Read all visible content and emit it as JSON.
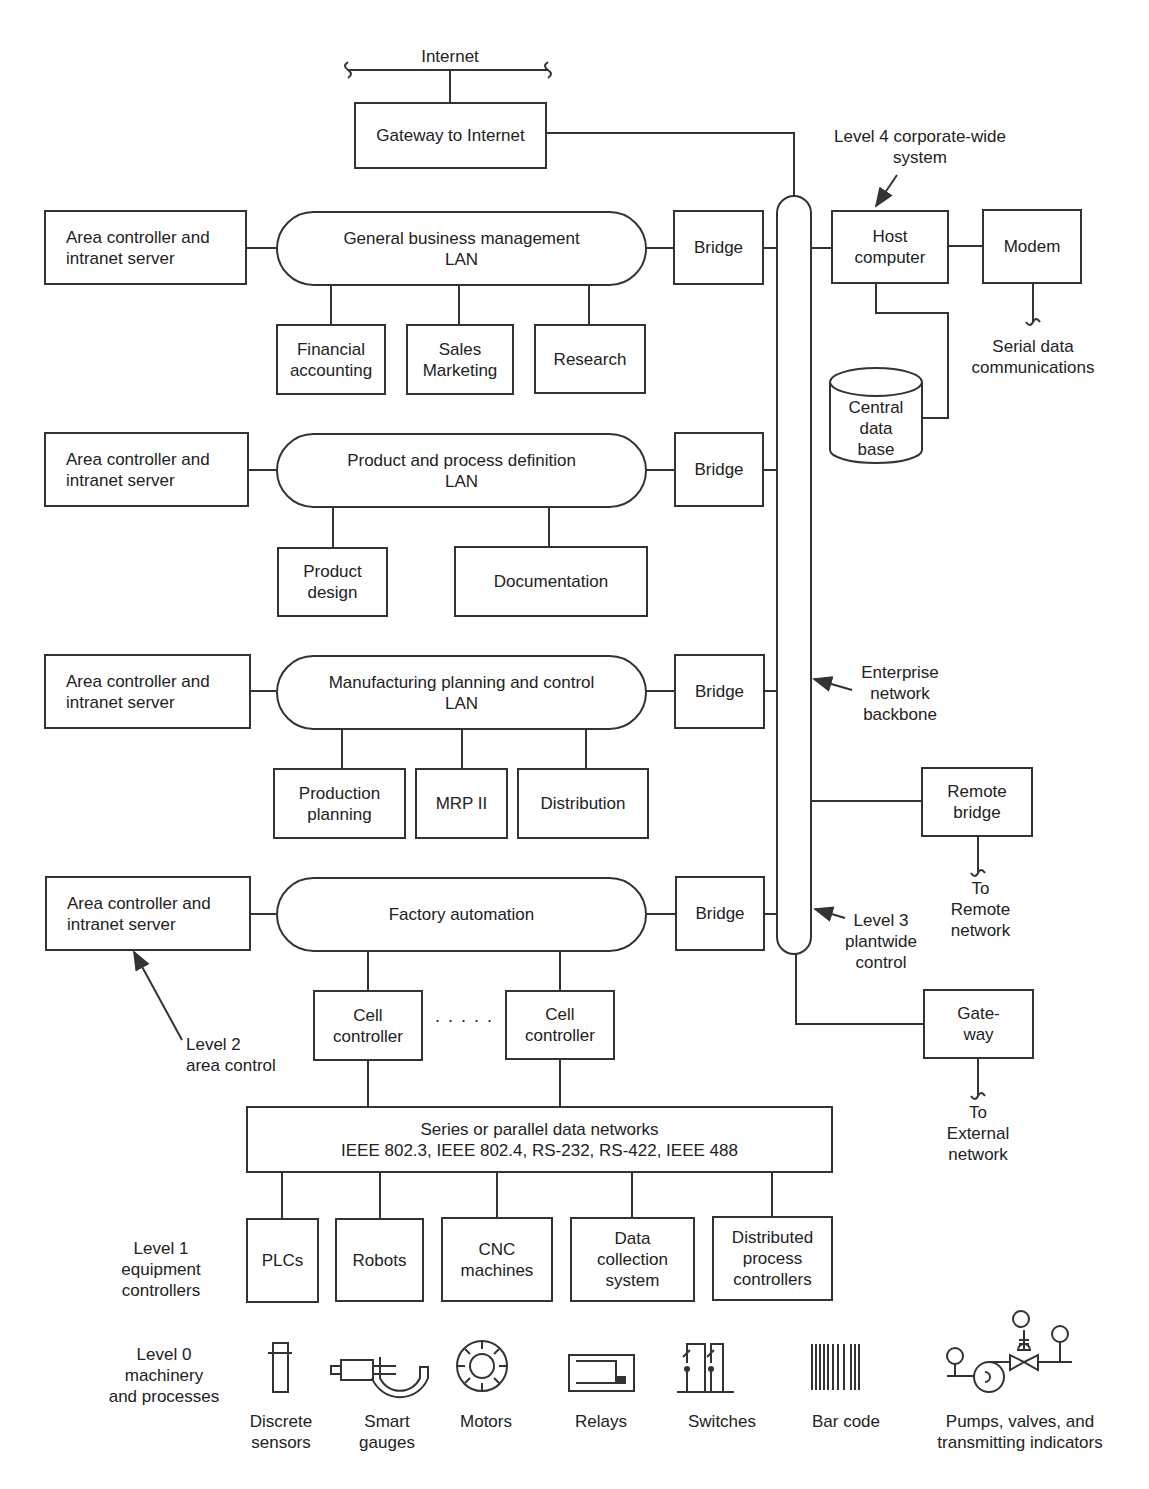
{
  "internet": {
    "label": "Internet",
    "gateway": "Gateway to Internet"
  },
  "level4": {
    "annotation": "Level 4 corporate-wide\nsystem",
    "host": "Host\ncomputer",
    "modem": "Modem",
    "serial": "Serial data\ncommunications",
    "database": "Central\ndata\nbase"
  },
  "backbone": {
    "annotation": "Enterprise\nnetwork\nbackbone",
    "level3": "Level 3\nplantwide\ncontrol",
    "remote_bridge": "Remote\nbridge",
    "remote_target": "To\nRemote\nnetwork",
    "gateway": "Gate-\nway",
    "external_target": "To\nExternal\nnetwork"
  },
  "lans": [
    {
      "area_controller": "Area controller and\nintranet server",
      "name": "General business management\nLAN",
      "bridge": "Bridge",
      "nodes": [
        "Financial\naccounting",
        "Sales\nMarketing",
        "Research"
      ]
    },
    {
      "area_controller": "Area controller and\nintranet server",
      "name": "Product and process definition\nLAN",
      "bridge": "Bridge",
      "nodes": [
        "Product\ndesign",
        "Documentation"
      ]
    },
    {
      "area_controller": "Area controller and\nintranet server",
      "name": "Manufacturing planning and control\nLAN",
      "bridge": "Bridge",
      "nodes": [
        "Production\nplanning",
        "MRP II",
        "Distribution"
      ]
    },
    {
      "area_controller": "Area controller and\nintranet server",
      "name": "Factory automation",
      "bridge": "Bridge",
      "nodes": [
        "Cell\ncontroller",
        "Cell\ncontroller"
      ],
      "ellipsis": "· · · · ·"
    }
  ],
  "level2": {
    "annotation": "Level 2\narea control"
  },
  "data_network": {
    "label": "Series or parallel data networks\nIEEE 802.3, IEEE 802.4, RS-232, RS-422, IEEE 488"
  },
  "level1": {
    "annotation": "Level 1\nequipment\ncontrollers",
    "devices": [
      "PLCs",
      "Robots",
      "CNC\nmachines",
      "Data\ncollection\nsystem",
      "Distributed\nprocess\ncontrollers"
    ]
  },
  "level0": {
    "annotation": "Level 0\nmachinery\nand processes",
    "items": [
      {
        "label": "Discrete\nsensors",
        "icon": "discrete-sensor-icon"
      },
      {
        "label": "Smart\ngauges",
        "icon": "smart-gauge-icon"
      },
      {
        "label": "Motors",
        "icon": "motor-icon"
      },
      {
        "label": "Relays",
        "icon": "relay-icon"
      },
      {
        "label": "Switches",
        "icon": "switches-icon"
      },
      {
        "label": "Bar code",
        "icon": "bar-code-icon"
      },
      {
        "label": "Pumps, valves, and\ntransmitting indicators",
        "icon": "pump-valve-icon"
      }
    ]
  }
}
